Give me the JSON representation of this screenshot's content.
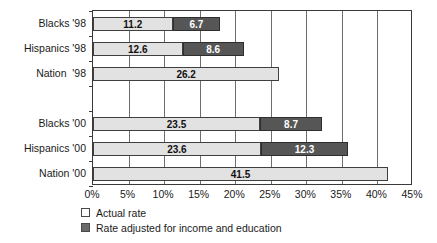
{
  "chart_data": {
    "type": "bar",
    "orientation": "horizontal",
    "stacked": true,
    "title": "",
    "subtitle": "",
    "xlabel": "",
    "ylabel": "",
    "xlim": [
      0,
      45
    ],
    "xticks": [
      0,
      5,
      10,
      15,
      20,
      25,
      30,
      35,
      40,
      45
    ],
    "xtick_labels": [
      "0%",
      "5%",
      "10%",
      "15%",
      "20%",
      "25%",
      "30%",
      "35%",
      "40%",
      "45%"
    ],
    "grid": "vertical",
    "legend_position": "bottom-left",
    "categories": [
      "Blacks '98",
      "Hispanics '98",
      "Nation  '98",
      "",
      "Blacks '00",
      "Hispanics '00",
      "Nation '00"
    ],
    "series": [
      {
        "name": "Actual rate",
        "color": "#e2e2e2",
        "values": [
          11.2,
          12.6,
          26.2,
          null,
          23.5,
          23.6,
          41.5
        ]
      },
      {
        "name": "Rate adjusted for income and education",
        "color": "#565656",
        "values": [
          6.7,
          8.6,
          null,
          null,
          8.7,
          12.3,
          null
        ]
      }
    ],
    "bars": [
      {
        "category": "Blacks '98",
        "segments": [
          {
            "series": "Actual rate",
            "value": 11.2,
            "label": "11.2",
            "style": "light"
          },
          {
            "series": "Rate adjusted for income and education",
            "value": 6.7,
            "label": "6.7",
            "style": "dark"
          }
        ],
        "total": 17.9
      },
      {
        "category": "Hispanics '98",
        "segments": [
          {
            "series": "Actual rate",
            "value": 12.6,
            "label": "12.6",
            "style": "light"
          },
          {
            "series": "Rate adjusted for income and education",
            "value": 8.6,
            "label": "8.6",
            "style": "dark"
          }
        ],
        "total": 21.2
      },
      {
        "category": "Nation  '98",
        "segments": [
          {
            "series": "Actual rate",
            "value": 26.2,
            "label": "26.2",
            "style": "light"
          }
        ],
        "total": 26.2
      },
      {
        "category": "",
        "segments": [],
        "total": 0
      },
      {
        "category": "Blacks '00",
        "segments": [
          {
            "series": "Actual rate",
            "value": 23.5,
            "label": "23.5",
            "style": "light"
          },
          {
            "series": "Rate adjusted for income and education",
            "value": 8.7,
            "label": "8.7",
            "style": "dark"
          }
        ],
        "total": 32.2
      },
      {
        "category": "Hispanics '00",
        "segments": [
          {
            "series": "Actual rate",
            "value": 23.6,
            "label": "23.6",
            "style": "light"
          },
          {
            "series": "Rate adjusted for income and education",
            "value": 12.3,
            "label": "12.3",
            "style": "dark"
          }
        ],
        "total": 35.9
      },
      {
        "category": "Nation '00",
        "segments": [
          {
            "series": "Actual rate",
            "value": 41.5,
            "label": "41.5",
            "style": "light"
          }
        ],
        "total": 41.5
      }
    ]
  },
  "legend": {
    "items": [
      {
        "label": "Actual rate",
        "style": "light"
      },
      {
        "label": "Rate adjusted for income and education",
        "style": "dark"
      }
    ]
  },
  "colors": {
    "actual_rate": "#e2e2e2",
    "adjusted_rate": "#565656",
    "axis": "#3a3a3a",
    "grid": "#6e6e6e",
    "text": "#1a1a1a",
    "background": "#ffffff"
  }
}
